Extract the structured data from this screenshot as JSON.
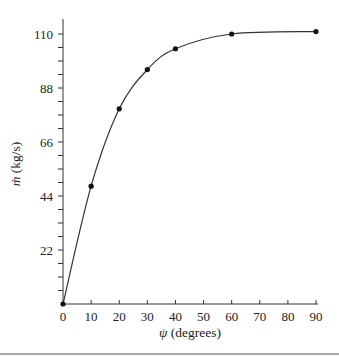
{
  "chart_data": {
    "type": "line",
    "title": "",
    "xlabel": "ψ (degrees)",
    "ylabel": "ṁ (kg/s)",
    "x": [
      0,
      10,
      20,
      30,
      40,
      60,
      90
    ],
    "series": [
      {
        "name": "mass flow rate",
        "values": [
          0,
          48,
          79.5,
          95.5,
          104,
          110,
          111
        ]
      }
    ],
    "xlim": [
      0,
      90
    ],
    "ylim": [
      0,
      110
    ],
    "xticks": [
      0,
      10,
      20,
      30,
      40,
      50,
      60,
      70,
      80,
      90
    ],
    "yticks": [
      22,
      44,
      66,
      88,
      110
    ],
    "y_minor_step": 5.5,
    "grid": false,
    "legend": null,
    "markers": true,
    "colors": {
      "line": "#333333",
      "marker": "#111111",
      "rule": "#a8a8a8"
    }
  }
}
